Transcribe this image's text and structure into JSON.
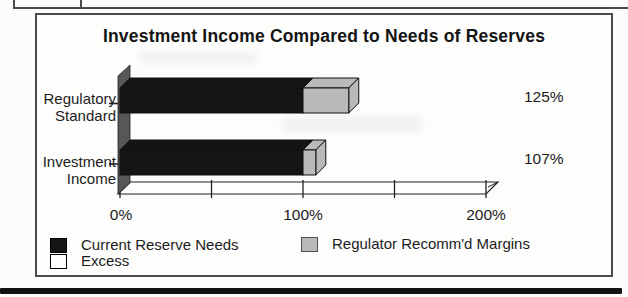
{
  "chart_data": {
    "type": "bar",
    "orientation": "horizontal",
    "stacked": true,
    "effect": "3d",
    "title": "Investment Income Compared to Needs of Reserves",
    "categories": [
      "Regulatory Standard",
      "Investment Income"
    ],
    "series": [
      {
        "name": "Current Reserve Needs",
        "color": "#151515",
        "values": [
          100,
          100
        ]
      },
      {
        "name": "Regulator Recomm'd Margins",
        "color": "#b9b9b9",
        "values": [
          25,
          7
        ]
      },
      {
        "name": "Excess",
        "color": "#ffffff",
        "values": [
          0,
          0
        ]
      }
    ],
    "totals": [
      125,
      107
    ],
    "data_labels": [
      "125%",
      "107%"
    ],
    "x_axis": {
      "min": 0,
      "max": 200,
      "tick_interval": 50,
      "tick_labels": [
        "0%",
        "100%",
        "200%"
      ],
      "unit": "%"
    },
    "gridlines": false,
    "wall_color": "#575757",
    "floor_color": "#ffffff",
    "legend": {
      "position": "bottom",
      "items": [
        {
          "label": "Current Reserve Needs",
          "color": "#151515",
          "border": "#000000"
        },
        {
          "label": "Regulator Recomm'd Margins",
          "color": "#b9b9b9",
          "border": "#4f4f4f"
        },
        {
          "label": "Excess",
          "color": "#ffffff",
          "border": "#000000"
        }
      ]
    }
  }
}
